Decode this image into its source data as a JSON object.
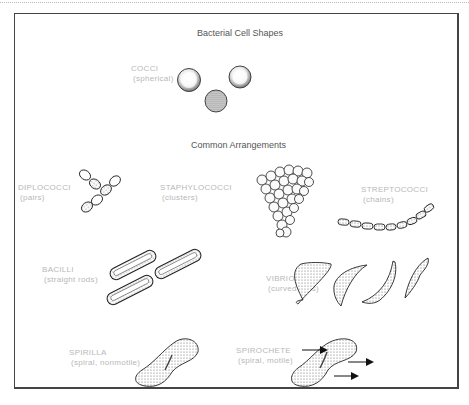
{
  "figure": {
    "title": "Bacterial Cell Shapes",
    "section_heading": "Common Arrangements",
    "shapes": [
      {
        "id": "cocci",
        "name": "COCCI",
        "description": "(spherical)"
      },
      {
        "id": "diplococci",
        "name": "DIPLOCOCCI",
        "description": "(pairs)"
      },
      {
        "id": "staphylococci",
        "name": "STAPHYLOCOCCI",
        "description": "(clusters)"
      },
      {
        "id": "streptococci",
        "name": "STREPTOCOCCI",
        "description": "(chains)"
      },
      {
        "id": "bacilli",
        "name": "BACILLI",
        "description": "(straight rods)"
      },
      {
        "id": "vibrios",
        "name": "VIBRIOS",
        "description": "(curved rods)"
      },
      {
        "id": "spirilla",
        "name": "SPIRILLA",
        "description": "(spiral, nonmotile)"
      },
      {
        "id": "spirochete",
        "name": "SPIROCHETE",
        "description": "(spiral, motile)"
      }
    ]
  }
}
